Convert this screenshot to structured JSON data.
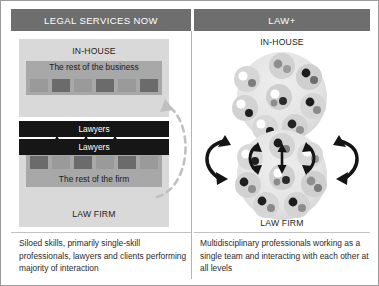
{
  "figure": {
    "columns": [
      {
        "header": "LEGAL SERVICES NOW"
      },
      {
        "header": "LAW+"
      }
    ]
  },
  "left_panel": {
    "inhouse_title": "IN-HOUSE",
    "lawfirm_title": "LAW FIRM",
    "rest_of_business": "The rest of the business",
    "rest_of_the_firm": "The rest of the firm",
    "lawyers_top": "Lawyers",
    "lawyers_bottom": "Lawyers",
    "squares_top": [
      "light",
      "dark",
      "light",
      "dark",
      "light",
      "dark"
    ],
    "squares_bottom": [
      "dark",
      "light",
      "dark",
      "light",
      "dark",
      "light"
    ],
    "connector_arrows": 3,
    "dashed_feedback_arrow": "client-interaction-loop",
    "caption": "Siloed skills, primarily single-skill professionals, lawyers and clients performing majority of interaction"
  },
  "right_panel": {
    "inhouse_title": "IN-HOUSE",
    "lawfirm_title": "LAW FIRM",
    "caption": "Multidisciplinary professionals working as a single team and interacting with each other at all levels",
    "cluster_top_members": 8,
    "cluster_bottom_members": 8,
    "connector_arrows": 5
  },
  "colors": {
    "header_bar": "#6e6e6e",
    "header_text": "#ffffff",
    "silo_box": "#d9d9d9",
    "rest_band": "#a8a8a8",
    "square_light": "#9a9a9a",
    "square_dark": "#6b6b6b",
    "lawyers_bar": "#161616",
    "frame_border": "#9a9a9a",
    "blob_fill": "#e2e2e2",
    "arrow": "#141414",
    "dashed_arrow": "#c0c0c0"
  }
}
